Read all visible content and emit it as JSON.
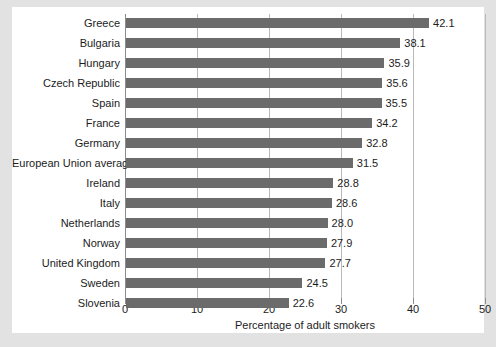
{
  "chart_data": {
    "type": "bar",
    "orientation": "horizontal",
    "title": "",
    "xlabel": "Percentage of adult smokers",
    "ylabel": "",
    "xlim": [
      0,
      50
    ],
    "xticks": [
      0,
      10,
      20,
      30,
      40,
      50
    ],
    "xtick_labels": [
      "0",
      "10",
      "20",
      "30",
      "40",
      "50"
    ],
    "grid": true,
    "grid_axis": "x",
    "legend": false,
    "bar_color": "#6b6b6b",
    "grid_color": "#b9b9b9",
    "axis_color": "#8c8c8c",
    "text_color": "#1c1c1c",
    "background": "#ffffff",
    "page_background": "#e2e2e2",
    "categories": [
      "Greece",
      "Bulgaria",
      "Hungary",
      "Czech Republic",
      "Spain",
      "France",
      "Germany",
      "European Union average",
      "Ireland",
      "Italy",
      "Netherlands",
      "Norway",
      "United Kingdom",
      "Sweden",
      "Slovenia"
    ],
    "values": [
      42.1,
      38.1,
      35.9,
      35.6,
      35.5,
      34.2,
      32.8,
      31.5,
      28.8,
      28.6,
      28.0,
      27.9,
      27.7,
      24.5,
      22.6
    ],
    "value_labels": [
      "42.1",
      "38.1",
      "35.9",
      "35.6",
      "35.5",
      "34.2",
      "32.8",
      "31.5",
      "28.8",
      "28.6",
      "28.0",
      "27.9",
      "27.7",
      "24.5",
      "22.6"
    ]
  }
}
